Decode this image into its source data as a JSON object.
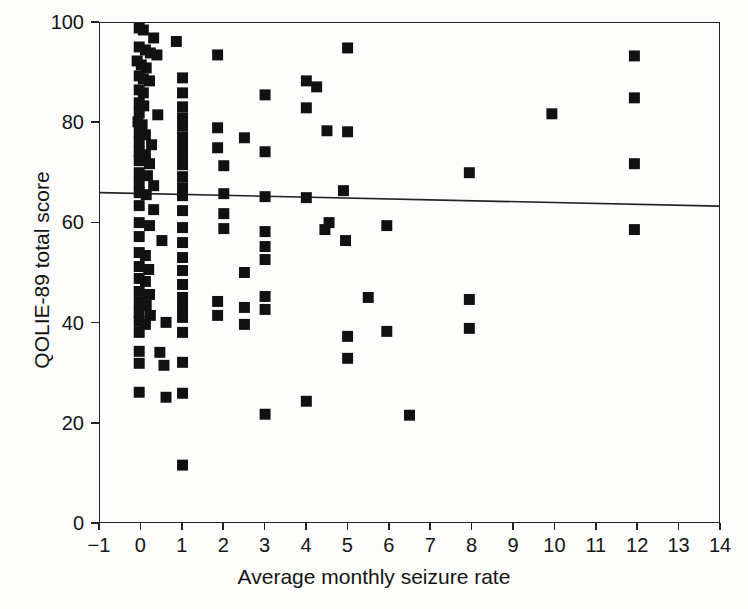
{
  "chart_data": {
    "type": "scatter",
    "title": "",
    "xlabel": "Average monthly seizure rate",
    "ylabel": "QOLIE-89 total score",
    "xlim": [
      -1,
      14
    ],
    "ylim": [
      0,
      100
    ],
    "xticks": [
      -1,
      0,
      1,
      2,
      3,
      4,
      5,
      6,
      7,
      8,
      9,
      10,
      11,
      12,
      13,
      14
    ],
    "yticks": [
      0,
      20,
      40,
      60,
      80,
      100
    ],
    "xticklabels": [
      "−1",
      "0",
      "1",
      "2",
      "3",
      "4",
      "5",
      "6",
      "7",
      "8",
      "9",
      "10",
      "11",
      "12",
      "13",
      "14"
    ],
    "yticklabels": [
      "0",
      "20",
      "40",
      "60",
      "80",
      "100"
    ],
    "grid": false,
    "legend": null,
    "marker": {
      "shape": "square",
      "color": "#111111",
      "size_px": 11
    },
    "series": [
      {
        "name": "Patients",
        "marker_color": "#111111",
        "points": [
          [
            -0.05,
            99.0
          ],
          [
            0.05,
            98.6
          ],
          [
            0.3,
            97.0
          ],
          [
            0.85,
            96.3
          ],
          [
            -0.05,
            95.2
          ],
          [
            0.1,
            94.6
          ],
          [
            0.22,
            94.0
          ],
          [
            0.38,
            93.6
          ],
          [
            1.85,
            93.6
          ],
          [
            11.95,
            93.4
          ],
          [
            -0.1,
            92.4
          ],
          [
            0.0,
            91.6
          ],
          [
            0.12,
            91.0
          ],
          [
            -0.05,
            89.4
          ],
          [
            0.05,
            88.8
          ],
          [
            0.2,
            88.4
          ],
          [
            1.0,
            89.0
          ],
          [
            4.0,
            88.4
          ],
          [
            4.25,
            87.2
          ],
          [
            -0.05,
            86.6
          ],
          [
            0.05,
            86.0
          ],
          [
            1.0,
            86.0
          ],
          [
            3.0,
            85.6
          ],
          [
            11.95,
            85.0
          ],
          [
            -0.05,
            84.0
          ],
          [
            0.06,
            83.4
          ],
          [
            1.0,
            83.2
          ],
          [
            4.0,
            83.0
          ],
          [
            -0.05,
            82.0
          ],
          [
            0.4,
            81.6
          ],
          [
            1.0,
            81.0
          ],
          [
            9.95,
            81.8
          ],
          [
            -0.08,
            80.2
          ],
          [
            0.02,
            79.6
          ],
          [
            1.0,
            79.4
          ],
          [
            1.85,
            79.0
          ],
          [
            -0.05,
            78.2
          ],
          [
            0.1,
            77.6
          ],
          [
            1.0,
            77.2
          ],
          [
            2.5,
            77.0
          ],
          [
            4.5,
            78.4
          ],
          [
            5.0,
            78.2
          ],
          [
            -0.05,
            76.2
          ],
          [
            0.25,
            75.6
          ],
          [
            1.0,
            75.4
          ],
          [
            1.85,
            75.0
          ],
          [
            -0.05,
            74.2
          ],
          [
            0.1,
            73.6
          ],
          [
            1.0,
            73.4
          ],
          [
            3.0,
            74.2
          ],
          [
            -0.05,
            72.4
          ],
          [
            0.2,
            71.8
          ],
          [
            1.0,
            71.6
          ],
          [
            2.0,
            71.4
          ],
          [
            7.95,
            70.0
          ],
          [
            11.95,
            71.8
          ],
          [
            -0.05,
            70.0
          ],
          [
            0.15,
            69.4
          ],
          [
            1.0,
            69.2
          ],
          [
            -0.05,
            68.0
          ],
          [
            0.3,
            67.4
          ],
          [
            1.0,
            67.0
          ],
          [
            4.9,
            66.4
          ],
          [
            -0.05,
            66.0
          ],
          [
            0.12,
            65.6
          ],
          [
            1.0,
            65.4
          ],
          [
            2.0,
            65.8
          ],
          [
            3.0,
            65.2
          ],
          [
            4.0,
            65.0
          ],
          [
            -0.05,
            63.4
          ],
          [
            0.3,
            62.6
          ],
          [
            1.0,
            62.4
          ],
          [
            2.0,
            61.8
          ],
          [
            4.55,
            60.0
          ],
          [
            -0.05,
            60.0
          ],
          [
            0.2,
            59.4
          ],
          [
            1.0,
            59.0
          ],
          [
            2.0,
            58.8
          ],
          [
            3.0,
            58.2
          ],
          [
            4.45,
            58.6
          ],
          [
            5.95,
            59.4
          ],
          [
            11.95,
            58.6
          ],
          [
            -0.05,
            57.2
          ],
          [
            0.5,
            56.4
          ],
          [
            1.0,
            56.0
          ],
          [
            3.0,
            55.2
          ],
          [
            4.95,
            56.4
          ],
          [
            -0.05,
            54.0
          ],
          [
            0.1,
            53.4
          ],
          [
            1.0,
            53.0
          ],
          [
            3.0,
            52.6
          ],
          [
            -0.05,
            51.2
          ],
          [
            0.18,
            50.6
          ],
          [
            1.0,
            50.4
          ],
          [
            2.5,
            50.0
          ],
          [
            -0.05,
            48.8
          ],
          [
            0.1,
            48.2
          ],
          [
            1.0,
            47.6
          ],
          [
            -0.05,
            46.2
          ],
          [
            0.2,
            45.6
          ],
          [
            1.0,
            45.0
          ],
          [
            3.0,
            45.2
          ],
          [
            5.5,
            45.0
          ],
          [
            7.95,
            44.6
          ],
          [
            -0.05,
            44.0
          ],
          [
            0.12,
            43.4
          ],
          [
            1.0,
            43.0
          ],
          [
            1.85,
            44.2
          ],
          [
            2.5,
            43.0
          ],
          [
            3.0,
            42.6
          ],
          [
            -0.05,
            42.0
          ],
          [
            0.22,
            41.4
          ],
          [
            1.0,
            41.0
          ],
          [
            1.85,
            41.4
          ],
          [
            2.5,
            39.6
          ],
          [
            5.95,
            38.2
          ],
          [
            7.95,
            38.8
          ],
          [
            -0.05,
            40.2
          ],
          [
            0.1,
            39.6
          ],
          [
            0.6,
            40.0
          ],
          [
            5.0,
            37.2
          ],
          [
            -0.05,
            38.0
          ],
          [
            1.0,
            38.0
          ],
          [
            -0.05,
            34.2
          ],
          [
            0.45,
            34.0
          ],
          [
            5.0,
            32.8
          ],
          [
            -0.05,
            31.8
          ],
          [
            0.55,
            31.4
          ],
          [
            1.0,
            32.0
          ],
          [
            -0.05,
            26.0
          ],
          [
            0.6,
            25.0
          ],
          [
            1.0,
            25.8
          ],
          [
            3.0,
            21.6
          ],
          [
            4.0,
            24.2
          ],
          [
            6.5,
            21.4
          ],
          [
            5.0,
            95.0
          ],
          [
            1.0,
            11.4
          ]
        ]
      }
    ],
    "fit_line": {
      "name": "regression line",
      "color": "#222222",
      "x0": -1,
      "y0": 66.0,
      "x1": 14,
      "y1": 63.3
    }
  }
}
